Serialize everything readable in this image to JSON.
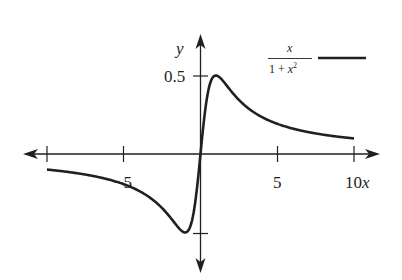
{
  "chart_data": {
    "type": "line",
    "title": "",
    "xlabel": "x",
    "ylabel": "y",
    "xlim": [
      -10,
      10
    ],
    "ylim": [
      -0.5,
      0.5
    ],
    "grid": false,
    "legend_position": "top-right",
    "x_ticks": [
      -10,
      -5,
      0,
      5,
      10
    ],
    "x_tick_labels": [
      "",
      "−5",
      "",
      "5",
      "10"
    ],
    "y_ticks": [
      -0.5,
      0.5
    ],
    "y_tick_labels": [
      "",
      "0.5"
    ],
    "series": [
      {
        "name": "x/(1+x^2)",
        "function": "x/(1+x^2)",
        "color": "#231f20",
        "x": [
          -10,
          -8,
          -6,
          -4,
          -3,
          -2,
          -1.5,
          -1,
          -0.5,
          0,
          0.5,
          1,
          1.5,
          2,
          3,
          4,
          6,
          8,
          10
        ],
        "values": [
          -0.099,
          -0.123,
          -0.162,
          -0.235,
          -0.3,
          -0.4,
          -0.462,
          -0.5,
          -0.4,
          0,
          0.4,
          0.5,
          0.462,
          0.4,
          0.3,
          0.235,
          0.162,
          0.123,
          0.099
        ]
      }
    ],
    "annotations": []
  },
  "labels": {
    "x_axis": "x",
    "y_axis": "y",
    "tick_neg5": "−5",
    "tick_5": "5",
    "tick_10": "10",
    "tick_y_half": "0.5",
    "legend_numerator": "x",
    "legend_denominator_one": "1 + ",
    "legend_denominator_x": "x",
    "legend_denominator_exp": "2"
  },
  "colors": {
    "ink": "#231f20",
    "background": "#ffffff"
  }
}
